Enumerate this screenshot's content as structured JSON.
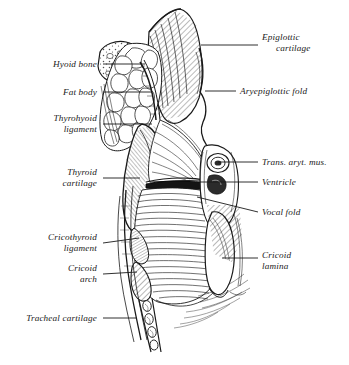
{
  "figure": {
    "background_color": "#ffffff",
    "ink_color": "#1a1a1a",
    "width": 349,
    "height": 365,
    "style": "engraved line drawing"
  },
  "labels": {
    "left": [
      {
        "name": "hyoid-bone",
        "line1": "Hyoid bone",
        "line2": "",
        "text_right_x": 97,
        "text_y": 59,
        "leader": {
          "x1": 103,
          "y1": 64,
          "x2": 145,
          "y2": 64
        }
      },
      {
        "name": "fat-body",
        "line1": "Fat body",
        "line2": "",
        "text_right_x": 97,
        "text_y": 87,
        "leader": {
          "x1": 103,
          "y1": 92,
          "x2": 152,
          "y2": 92
        }
      },
      {
        "name": "thyrohyoid-ligament",
        "line1": "Thyrohyoid",
        "line2": "ligament",
        "text_right_x": 97,
        "text_y": 113,
        "leader": {
          "x1": 103,
          "y1": 124,
          "x2": 152,
          "y2": 124
        }
      },
      {
        "name": "thyroid-cartilage",
        "line1": "Thyroid",
        "line2": "cartilage",
        "text_right_x": 97,
        "text_y": 167,
        "leader": {
          "x1": 103,
          "y1": 178,
          "x2": 140,
          "y2": 178
        }
      },
      {
        "name": "cricothyroid-ligament",
        "line1": "Cricothyroid",
        "line2": "ligament",
        "text_right_x": 97,
        "text_y": 232,
        "leader": {
          "x1": 103,
          "y1": 243,
          "x2": 139,
          "y2": 238
        }
      },
      {
        "name": "cricoid-arch",
        "line1": "Cricoid",
        "line2": "arch",
        "text_right_x": 97,
        "text_y": 263,
        "leader": {
          "x1": 103,
          "y1": 274,
          "x2": 137,
          "y2": 272
        }
      },
      {
        "name": "tracheal-cartilage",
        "line1": "Tracheal cartilage",
        "line2": "",
        "text_right_x": 97,
        "text_y": 313,
        "leader": {
          "x1": 103,
          "y1": 318,
          "x2": 136,
          "y2": 318
        }
      }
    ],
    "right": [
      {
        "name": "epiglottic-cartilage",
        "line1": "Epiglottic",
        "line2": "cartilage",
        "text_left_x": 262,
        "text_y": 32,
        "indent": true,
        "leader": {
          "x1": 201,
          "y1": 45,
          "x2": 258,
          "y2": 45
        }
      },
      {
        "name": "aryepiglottic-fold",
        "line1": "Aryepiglottic fold",
        "line2": "",
        "text_left_x": 240,
        "text_y": 86,
        "indent": false,
        "leader": {
          "x1": 205,
          "y1": 91,
          "x2": 236,
          "y2": 91
        }
      },
      {
        "name": "trans-aryt-mus",
        "line1": "Trans. aryt. mus.",
        "line2": "",
        "text_left_x": 262,
        "text_y": 157,
        "indent": false,
        "leader": {
          "x1": 218,
          "y1": 162,
          "x2": 258,
          "y2": 162
        }
      },
      {
        "name": "ventricle",
        "line1": "Ventricle",
        "line2": "",
        "text_left_x": 262,
        "text_y": 177,
        "indent": false,
        "leader": {
          "x1": 196,
          "y1": 182,
          "x2": 258,
          "y2": 182
        }
      },
      {
        "name": "vocal-fold",
        "line1": "Vocal fold",
        "line2": "",
        "text_left_x": 262,
        "text_y": 207,
        "indent": false,
        "leader": {
          "x1": 197,
          "y1": 197,
          "x2": 258,
          "y2": 212
        }
      },
      {
        "name": "cricoid-lamina",
        "line1": "Cricoid",
        "line2": "lamina",
        "text_left_x": 262,
        "text_y": 250,
        "indent": false,
        "leader": {
          "x1": 222,
          "y1": 258,
          "x2": 258,
          "y2": 258
        }
      }
    ]
  }
}
